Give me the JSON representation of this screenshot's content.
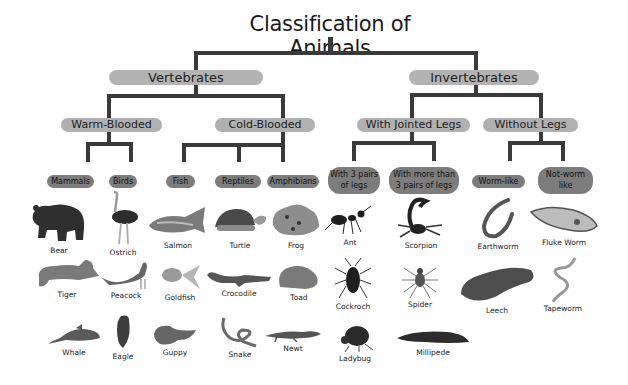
{
  "title": "Classification of Animals",
  "level1": [
    {
      "label": "Vertebrates"
    },
    {
      "label": "Invertebrates"
    }
  ],
  "level2": [
    {
      "label": "Warm-Blooded",
      "parent": "Vertebrates"
    },
    {
      "label": "Cold-Blooded",
      "parent": "Vertebrates"
    },
    {
      "label": "With Jointed Legs",
      "parent": "Invertebrates"
    },
    {
      "label": "Without Legs",
      "parent": "Invertebrates"
    }
  ],
  "level3": [
    {
      "label": "Mammals",
      "parent": "Warm-Blooded"
    },
    {
      "label": "Birds",
      "parent": "Warm-Blooded"
    },
    {
      "label": "Fish",
      "parent": "Cold-Blooded"
    },
    {
      "label": "Reptiles",
      "parent": "Cold-Blooded"
    },
    {
      "label": "Amphibians",
      "parent": "Cold-Blooded"
    },
    {
      "label_line1": "With 3 pairs",
      "label_line2": "of legs",
      "parent": "With Jointed Legs"
    },
    {
      "label_line1": "With more than",
      "label_line2": "3 pairs of legs",
      "parent": "With Jointed Legs"
    },
    {
      "label": "Worm-like",
      "parent": "Without Legs"
    },
    {
      "label_line1": "Not-worm",
      "label_line2": "like",
      "parent": "Without Legs"
    }
  ],
  "animals": {
    "mammals": [
      "Bear",
      "Tiger",
      "Whale"
    ],
    "birds": [
      "Ostrich",
      "Peacock",
      "Eagle"
    ],
    "fish": [
      "Salmon",
      "Goldfish",
      "Guppy"
    ],
    "reptiles": [
      "Turtle",
      "Crocodile",
      "Snake"
    ],
    "amphibians": [
      "Frog",
      "Toad",
      "Newt"
    ],
    "three_pairs_legs": [
      "Ant",
      "Cockroch",
      "Ladybug"
    ],
    "more_than_three_pairs_legs": [
      "Scorpion",
      "Spider",
      "Millipede"
    ],
    "worm_like": [
      "Earthworm",
      "Leech"
    ],
    "not_worm_like": [
      "Fluke Worm",
      "Tapeworm"
    ]
  },
  "colors": {
    "line": "#3a3a3a",
    "pill_light": "#b3b3b3",
    "pill_dark": "#7d7d7d",
    "background": "#ffffff"
  }
}
